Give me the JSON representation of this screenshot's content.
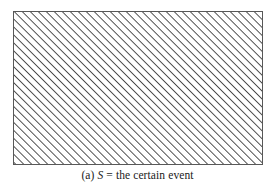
{
  "figure": {
    "label": "(a)",
    "symbol": "S",
    "equals": "=",
    "description": "the certain event",
    "caption_full": "(a) S = the certain event",
    "shape": {
      "kind": "rectangle",
      "name": "sample-space-rectangle",
      "x": 13,
      "y": 11,
      "width": 250,
      "height": 154,
      "border_color": "#585858",
      "border_width_px": 1,
      "fill_color": "#ffffff"
    },
    "hatching": {
      "style": "diagonal-lines",
      "angle_degrees": 45,
      "direction": "lower-left-to-upper-right",
      "spacing_px": 5.7,
      "line_width_px": 1,
      "line_color": "#4a4a4a"
    }
  },
  "canvas": {
    "width": 275,
    "height": 190,
    "background_color": "#ffffff"
  }
}
